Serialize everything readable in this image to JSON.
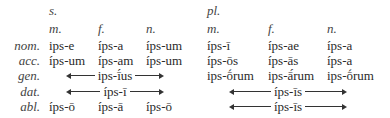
{
  "headers": {
    "singular": "s.",
    "plural": "pl.",
    "genders": [
      "m.",
      "f.",
      "n."
    ]
  },
  "cases": [
    "nom.",
    "acc.",
    "gen.",
    "dat.",
    "abl."
  ],
  "singular": {
    "nom": [
      "ips-e",
      "íps-a",
      "íps-um"
    ],
    "acc": [
      "íps-um",
      "íps-am",
      "íps-um"
    ],
    "gen": "ips-ī́us",
    "dat": "íps-ī",
    "abl": [
      "íps-ō",
      "íps-ā",
      "íps-ō"
    ]
  },
  "plural": {
    "nom": [
      "íps-ī",
      "íps-ae",
      "íps-a"
    ],
    "acc": [
      "íps-ōs",
      "íps-ās",
      "íps-a"
    ],
    "gen": [
      "ips-ṓrum",
      "ips-ā́rum",
      "ips-ṓrum"
    ],
    "dat": "íps-īs",
    "abl": "íps-īs"
  }
}
